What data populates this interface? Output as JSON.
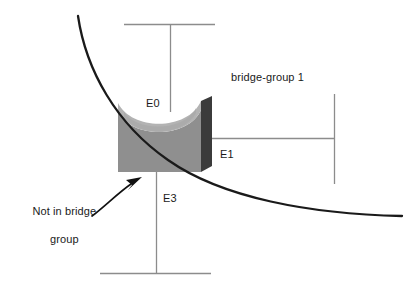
{
  "diagram": {
    "background_color": "#ffffff",
    "labels": {
      "e0": "E0",
      "e1": "E1",
      "e3": "E3",
      "bridge_group": "bridge-group 1",
      "not_in_bridge_group_line1": "Not in bridge",
      "not_in_bridge_group_line2": "group"
    },
    "colors": {
      "line": "#8c8c8c",
      "curve": "#1a1a1a",
      "text": "#1a1a1a",
      "box_top": "#b3b3b3",
      "box_body": "#8f8f8f",
      "box_side": "#3b3b3b",
      "arrow": "#111111"
    },
    "segments": [
      {
        "name": "top-segment",
        "interface": "E0",
        "orientation": "horizontal-bar-with-drop"
      },
      {
        "name": "right-segment",
        "interface": "E1",
        "orientation": "vertical-bar-with-lead"
      },
      {
        "name": "bottom-segment",
        "interface": "E3",
        "orientation": "horizontal-bar-with-riser"
      }
    ],
    "annotations": [
      {
        "name": "bridge-group-annotation",
        "text": "bridge-group 1"
      },
      {
        "name": "not-in-bridge-group-annotation",
        "text": "Not in bridge group",
        "has_arrow": true
      }
    ]
  }
}
